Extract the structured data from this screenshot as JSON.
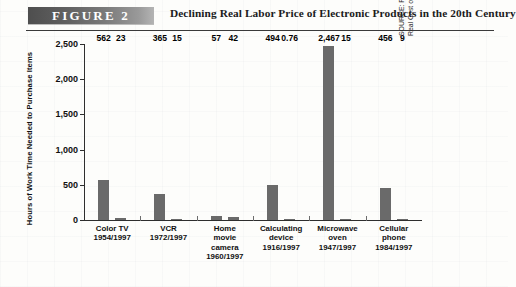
{
  "header": {
    "figure_badge": "FIGURE  2",
    "title": "Declining Real Labor Price of Electronic Products in the 20th Century"
  },
  "source": "SOURCE: Federal Reserve Bank of Dallas, \"Time Well Spent: The Declining Real Cost of Living in America,\" 1997 Annual Report, 1997.",
  "colors": {
    "bar": "#6a6a6a",
    "axis": "#2e2e2e",
    "badge_dark": "#4e4e4e",
    "badge_light": "#b4b4b4",
    "text": "#101010",
    "background": "#fdfdfb"
  },
  "chart_data": {
    "type": "bar",
    "title": "Declining Real Labor Price of Electronic Products in the 20th Century",
    "xlabel": "",
    "ylabel": "Hours of Work Time Needed to Purchase Items",
    "ylim": [
      0,
      2500
    ],
    "yticks": [
      "0",
      "500",
      "1,000",
      "1,500",
      "2,000",
      "2,500"
    ],
    "ytick_values": [
      0,
      500,
      1000,
      1500,
      2000,
      2500
    ],
    "grid": false,
    "legend": "none",
    "categories": [
      "Color TV\n1954/1997",
      "VCR\n1972/1997",
      "Home\nmovie\ncamera\n1960/1997",
      "Calculating\ndevice\n1916/1997",
      "Microwave\noven\n1947/1997",
      "Cellular\nphone\n1984/1997"
    ],
    "category_lines": [
      [
        "Color TV",
        "1954/1997"
      ],
      [
        "VCR",
        "1972/1997"
      ],
      [
        "Home",
        "movie",
        "camera",
        "1960/1997"
      ],
      [
        "Calculating",
        "device",
        "1916/1997"
      ],
      [
        "Microwave",
        "oven",
        "1947/1997"
      ],
      [
        "Cellular",
        "phone",
        "1984/1997"
      ]
    ],
    "series": [
      {
        "name": "Earlier year",
        "values": [
          562,
          365,
          57,
          494,
          2467,
          456
        ],
        "labels": [
          "562",
          "365",
          "57",
          "494",
          "2,467",
          "456"
        ]
      },
      {
        "name": "1997",
        "values": [
          23,
          15,
          42,
          0.76,
          15,
          9
        ],
        "labels": [
          "23",
          "15",
          "42",
          "0.76",
          "15",
          "9"
        ]
      }
    ]
  }
}
